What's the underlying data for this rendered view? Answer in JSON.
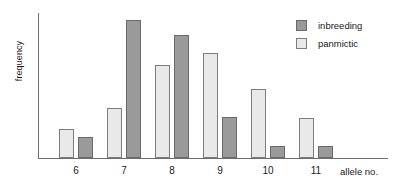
{
  "chart_data": {
    "type": "bar",
    "title": "",
    "xlabel": "allele no.",
    "ylabel": "frequency",
    "categories": [
      "6",
      "7",
      "8",
      "9",
      "10",
      "11"
    ],
    "series": [
      {
        "name": "inbreeding",
        "color": "#9a9a9a",
        "values": [
          0.15,
          1.0,
          0.89,
          0.3,
          0.09,
          0.09
        ]
      },
      {
        "name": "panmictic",
        "color": "#e9e9e9",
        "values": [
          0.21,
          0.36,
          0.67,
          0.76,
          0.5,
          0.29
        ]
      }
    ],
    "ylim": [
      0,
      1.05
    ],
    "y_ticks": [],
    "grid": false,
    "legend_position": "top-right",
    "axis_color": "#6e6e6e"
  },
  "legend": {
    "entries": [
      {
        "label": "inbreeding",
        "icon": "square-swatch-dark"
      },
      {
        "label": "panmictic",
        "icon": "square-swatch-light"
      }
    ]
  }
}
